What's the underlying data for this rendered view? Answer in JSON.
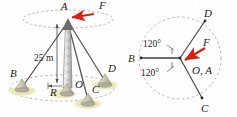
{
  "figure": {
    "type": "engineering-diagram",
    "background": "#fefefe"
  },
  "colors": {
    "force_arrow": "#d81f12",
    "cable": "#565656",
    "mast_outline": "#4a4a4a",
    "dashed_circle": "#9a9a9a",
    "anchor_base": "#b9b3a2",
    "ground_glow": "#efe9bf",
    "label": "#1b1b1b"
  },
  "left_view": {
    "name": "side-view",
    "labels": {
      "apex": "A",
      "force": "F",
      "anchor_b": "B",
      "anchor_c": "C",
      "anchor_d": "D",
      "center": "O",
      "radius": "R",
      "height": "25 m"
    }
  },
  "right_view": {
    "name": "top-view",
    "labels": {
      "anchor_b": "B",
      "anchor_c": "C",
      "anchor_d": "D",
      "force": "F",
      "center": "O, A",
      "angle_upper": "120°",
      "angle_lower": "120°"
    }
  }
}
